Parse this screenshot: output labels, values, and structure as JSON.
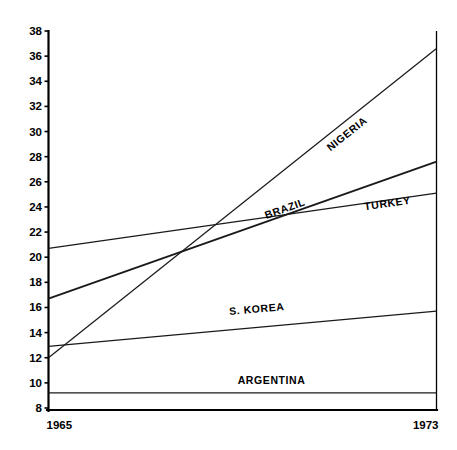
{
  "chart_data": {
    "type": "line",
    "title": "",
    "subtitle": "",
    "xlabel": "",
    "ylabel": "",
    "x": [
      1965,
      1973
    ],
    "xtick_labels": [
      "1965",
      "1973"
    ],
    "xlim": [
      1965,
      1973
    ],
    "ylim": [
      8,
      38
    ],
    "ytick_labels": [
      "38",
      "36",
      "34",
      "32",
      "30",
      "28",
      "26",
      "24",
      "22",
      "20",
      "18",
      "16",
      "14",
      "12",
      "10",
      "8"
    ],
    "ytick_values": [
      38,
      36,
      34,
      32,
      30,
      28,
      26,
      24,
      22,
      20,
      18,
      16,
      14,
      12,
      10,
      8
    ],
    "grid": false,
    "legend_position": "inline-labels",
    "series": [
      {
        "name": "NIGERIA",
        "values": [
          12.0,
          36.6
        ],
        "label_text": "NIGERIA"
      },
      {
        "name": "BRAZIL",
        "values": [
          16.7,
          27.6
        ],
        "label_text": "BRAZIL"
      },
      {
        "name": "TURKEY",
        "values": [
          20.7,
          25.1
        ],
        "label_text": "TURKEY"
      },
      {
        "name": "S. KOREA",
        "values": [
          12.9,
          15.7
        ],
        "label_text": "S. KOREA"
      },
      {
        "name": "ARGENTINA",
        "values": [
          9.2,
          9.2
        ],
        "label_text": "ARGENTINA"
      }
    ],
    "annotations": [
      {
        "text": "NIGERIA",
        "x": 1971.2,
        "y": 29.6
      },
      {
        "text": "BRAZIL",
        "x": 1969.9,
        "y": 23.6
      },
      {
        "text": "TURKEY",
        "x": 1972.0,
        "y": 24.0
      },
      {
        "text": "S. KOREA",
        "x": 1969.3,
        "y": 15.6
      },
      {
        "text": "ARGENTINA",
        "x": 1969.6,
        "y": 9.9
      }
    ],
    "colors": {
      "axis": "#000000",
      "line": "#1a1a1a",
      "background": "#ffffff",
      "text": "#000000"
    }
  },
  "axis": {
    "y_ticks": [
      "38",
      "36",
      "34",
      "32",
      "30",
      "28",
      "26",
      "24",
      "22",
      "20",
      "18",
      "16",
      "14",
      "12",
      "10",
      "8"
    ],
    "x_ticks": [
      "1965",
      "1973"
    ]
  },
  "labels": {
    "nigeria": "NIGERIA",
    "brazil": "BRAZIL",
    "turkey": "TURKEY",
    "skorea": "S. KOREA",
    "argentina": "ARGENTINA"
  }
}
